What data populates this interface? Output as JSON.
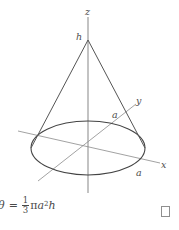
{
  "figure": {
    "type": "geometry-diagram",
    "shape": "cone",
    "labels": {
      "z_axis": "z",
      "height": "h",
      "y_axis": "y",
      "x_axis": "x",
      "radius_y": "a",
      "radius_x": "a"
    },
    "colors": {
      "cone_outline": "#555555",
      "base_ellipse": "#444444",
      "axis_line": "#8a8a8a",
      "vertical_axis": "#b4b4b4",
      "label_text": "#4d4d4d",
      "background": "#ffffff"
    },
    "geometry": {
      "apex": [
        88,
        40
      ],
      "center": [
        88,
        148
      ],
      "ellipse_rx": 57,
      "ellipse_ry": 27,
      "base_left": [
        31,
        148
      ],
      "base_right": [
        145,
        148
      ]
    }
  },
  "formula": {
    "lhs": "θ",
    "equals": "=",
    "fraction_numerator": "1",
    "fraction_denominator": "3",
    "pi": "π",
    "radius_symbol": "a",
    "radius_exponent": "2",
    "height_symbol": "h",
    "full_text": "θ = 1/3 πa²h"
  },
  "qed": {
    "symbol": "open-square",
    "meaning": "end of proof"
  }
}
